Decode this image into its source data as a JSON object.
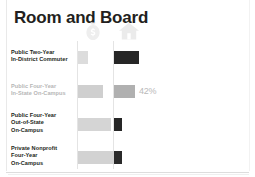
{
  "card": {
    "title": "Room and Board"
  },
  "icons": [
    {
      "name": "money-bag-icon",
      "color": "#efefef"
    },
    {
      "name": "house-icon",
      "color": "#ececec"
    }
  ],
  "chart_data": {
    "type": "bar",
    "title": "Room and Board",
    "xlabel": "",
    "ylabel": "",
    "grid": false,
    "legend": "none",
    "orientation": "horizontal",
    "categories": [
      "Public Two-Year In-District Commuter",
      "Public Four-Year In-State On-Campus",
      "Public Four-Year Out-of-State On-Campus",
      "Private Nonprofit Four-Year On-Campus"
    ],
    "series": [
      {
        "name": "Cost",
        "color": "#d9d9d9",
        "values": [
          10,
          25,
          33,
          36
        ]
      },
      {
        "name": "Room and Board Share",
        "color": "#2b2b2b",
        "values": [
          25,
          21,
          8,
          8
        ]
      }
    ],
    "annotations": [
      {
        "row": 1,
        "text": "42%",
        "color": "#b9b9b9"
      }
    ]
  },
  "rows": [
    {
      "label_lines": [
        "Public Two-Year",
        "In-District Commuter"
      ],
      "highlighted": false,
      "left_bar": {
        "width": 10,
        "color": "#dcdcdc"
      },
      "right_bar": {
        "width": 25,
        "color": "#262626"
      },
      "value": ""
    },
    {
      "label_lines": [
        "Public Four-Year",
        "In-State On-Campus"
      ],
      "highlighted": true,
      "left_bar": {
        "width": 25,
        "color": "#cfcfcf"
      },
      "right_bar": {
        "width": 21,
        "color": "#b0b0b0"
      },
      "value": "42%"
    },
    {
      "label_lines": [
        "Public Four-Year",
        "Out-of-State",
        "On-Campus"
      ],
      "highlighted": false,
      "left_bar": {
        "width": 33,
        "color": "#d5d5d5"
      },
      "right_bar": {
        "width": 8,
        "color": "#262626"
      },
      "value": ""
    },
    {
      "label_lines": [
        "Private Nonprofit",
        "Four-Year",
        "On-Campus"
      ],
      "highlighted": false,
      "left_bar": {
        "width": 36,
        "color": "#d2d2d2"
      },
      "right_bar": {
        "width": 8,
        "color": "#2a2a2a"
      },
      "value": ""
    }
  ]
}
